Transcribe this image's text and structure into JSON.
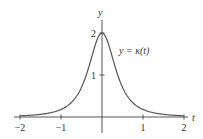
{
  "chart_data": {
    "type": "line",
    "title": "",
    "xlabel": "t",
    "ylabel": "y",
    "xlim": [
      -2.15,
      2.15
    ],
    "ylim": [
      0,
      2.3
    ],
    "x_ticks": [
      "−2",
      "−1",
      "1",
      "2"
    ],
    "x_tick_values": [
      -2,
      -1,
      1,
      2
    ],
    "y_ticks": [
      "1",
      "2"
    ],
    "y_tick_values": [
      1,
      2
    ],
    "grid": false,
    "series": [
      {
        "name": "y = κ(t)",
        "formula": "2/(1+4t^2)^(3/2)",
        "x": [
          -2,
          -1.5,
          -1,
          -0.75,
          -0.5,
          -0.25,
          0,
          0.25,
          0.5,
          0.75,
          1,
          1.5,
          2
        ],
        "y": [
          0.03,
          0.06,
          0.18,
          0.36,
          0.71,
          1.43,
          2,
          1.43,
          0.71,
          0.36,
          0.18,
          0.06,
          0.03
        ]
      }
    ],
    "annotation": "y = κ(t)",
    "color": "#555555"
  }
}
